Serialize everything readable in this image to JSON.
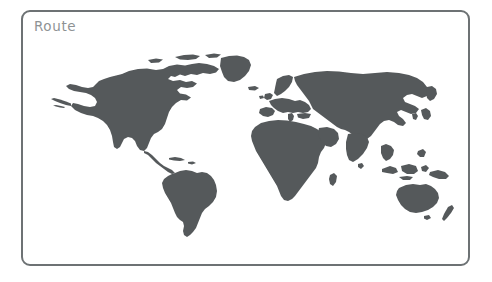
{
  "canvas": {
    "width": 492,
    "height": 282,
    "background_color": "#ffffff"
  },
  "card": {
    "title": "Route",
    "title_color": "#8e9294",
    "border_color": "#6d7274",
    "border_width_px": 2,
    "corner_radius_px": 9,
    "background_color": "#ffffff"
  },
  "map": {
    "name": "world-map",
    "projection": "equirectangular",
    "land_color": "#55595b",
    "ocean_color": "#ffffff",
    "route_overlay": "none",
    "markers": "none",
    "graticule": "none",
    "labels": "none",
    "continents": [
      "North America",
      "South America",
      "Greenland",
      "Europe",
      "Africa",
      "Asia",
      "Australia",
      "New Zealand"
    ]
  }
}
